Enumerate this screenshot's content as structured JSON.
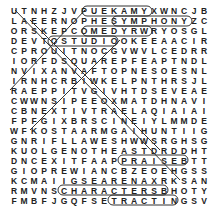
{
  "puzzle": {
    "type": "word-search",
    "rows": [
      "UTNHZJVPUEKAMYXWNCJB",
      "LAEERNOPHESYMPHONYZC",
      "ORSKEPCOMEDYRWRYOSGL",
      "DEVTOSTUDIOOKEEAACIR",
      "CPROUITNOCGVWVLCEDRR",
      "IORFDSQUAREPFEAPTNDL",
      "NVIXANVAFTOPNESOESNL",
      "IRNHCRBIWKELPNTHRSJL",
      "RAEPPITVGIVHTDSEVEAE",
      "CWWNSIPEEOXMATDHNAVI",
      "CBNEXTIVTRAELAQIAIAI",
      "FPFGIXBRSCINEIYLMMDE",
      "WFKOSTAARMGAIHUNTIIG",
      "GNRIFLLAWESHWWSRGHSG",
      "KUOLGENOTHEASTDRDDHT",
      "DNCEXITFAAPPRAISEBTT",
      "GIOPREWIANCBZEOEHGSS",
      "KCMAIIGSEARENAXRKSAN",
      "RMVNSCHARACTERSBHOTY",
      "FMBFJGQFSETRACTINGSV"
    ],
    "highlighted_words": [
      "PUEKAM",
      "SYMPHONY",
      "COMEDY",
      "STUDIO",
      "APPRAISE",
      "CHARACTERS",
      "RACTING"
    ]
  }
}
